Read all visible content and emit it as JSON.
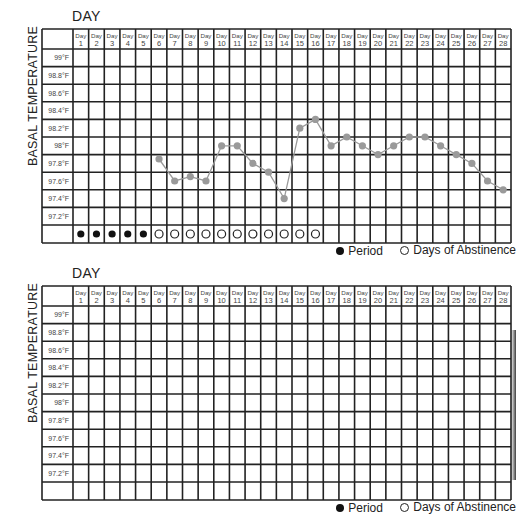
{
  "charts": [
    {
      "x_title": "DAY",
      "y_title": "BASAL TEMPERATURE",
      "legend": {
        "period_label": "Period",
        "abstinence_label": "Days of Abstinence"
      }
    },
    {
      "x_title": "DAY",
      "y_title": "BASAL TEMPERATURE",
      "legend": {
        "period_label": "Period",
        "abstinence_label": "Days of Abstinence"
      }
    }
  ],
  "colors": {
    "grid": "#222222",
    "series": "#9a9a9a",
    "period": "#111111"
  },
  "chart_data": [
    {
      "type": "line",
      "title": "",
      "xlabel": "DAY",
      "ylabel": "BASAL TEMPERATURE",
      "day_label_prefix": "Day",
      "x": [
        1,
        2,
        3,
        4,
        5,
        6,
        7,
        8,
        9,
        10,
        11,
        12,
        13,
        14,
        15,
        16,
        17,
        18,
        19,
        20,
        21,
        22,
        23,
        24,
        25,
        26,
        27,
        28
      ],
      "y_tick_labels": [
        "99°F",
        "98.8°F",
        "98.6°F",
        "98.4°F",
        "98.2°F",
        "98°F",
        "97.8°F",
        "97.6°F",
        "97.4°F",
        "97.2°F"
      ],
      "y_ticks": [
        99.0,
        98.8,
        98.6,
        98.4,
        98.2,
        98.0,
        97.8,
        97.6,
        97.4,
        97.2
      ],
      "ylim": [
        97.1,
        99.1
      ],
      "grid": true,
      "series": [
        {
          "name": "Basal temperature",
          "points": [
            {
              "day": 6,
              "temp": 97.85
            },
            {
              "day": 7,
              "temp": 97.6
            },
            {
              "day": 8,
              "temp": 97.65
            },
            {
              "day": 9,
              "temp": 97.6
            },
            {
              "day": 10,
              "temp": 98.0
            },
            {
              "day": 11,
              "temp": 98.0
            },
            {
              "day": 12,
              "temp": 97.8
            },
            {
              "day": 13,
              "temp": 97.7
            },
            {
              "day": 14,
              "temp": 97.4
            },
            {
              "day": 15,
              "temp": 98.2
            },
            {
              "day": 16,
              "temp": 98.3
            },
            {
              "day": 17,
              "temp": 98.0
            },
            {
              "day": 18,
              "temp": 98.1
            },
            {
              "day": 19,
              "temp": 98.0
            },
            {
              "day": 20,
              "temp": 97.9
            },
            {
              "day": 21,
              "temp": 98.0
            },
            {
              "day": 22,
              "temp": 98.1
            },
            {
              "day": 23,
              "temp": 98.1
            },
            {
              "day": 24,
              "temp": 98.0
            },
            {
              "day": 25,
              "temp": 97.9
            },
            {
              "day": 26,
              "temp": 97.8
            },
            {
              "day": 27,
              "temp": 97.6
            },
            {
              "day": 28,
              "temp": 97.5
            }
          ]
        }
      ],
      "markers": {
        "period_days": [
          1,
          2,
          3,
          4,
          5
        ],
        "abstinence_days": [
          6,
          7,
          8,
          9,
          10,
          11,
          12,
          13,
          14,
          15,
          16
        ]
      },
      "legend": [
        "Period",
        "Days of Abstinence"
      ],
      "legend_position": "bottom-right"
    },
    {
      "type": "line",
      "title": "",
      "xlabel": "DAY",
      "ylabel": "BASAL TEMPERATURE",
      "day_label_prefix": "Day",
      "x": [
        1,
        2,
        3,
        4,
        5,
        6,
        7,
        8,
        9,
        10,
        11,
        12,
        13,
        14,
        15,
        16,
        17,
        18,
        19,
        20,
        21,
        22,
        23,
        24,
        25,
        26,
        27,
        28
      ],
      "y_tick_labels": [
        "99°F",
        "98.8°F",
        "98.6°F",
        "98.4°F",
        "98.2°F",
        "98°F",
        "97.8°F",
        "97.6°F",
        "97.4°F",
        "97.2°F"
      ],
      "y_ticks": [
        99.0,
        98.8,
        98.6,
        98.4,
        98.2,
        98.0,
        97.8,
        97.6,
        97.4,
        97.2
      ],
      "ylim": [
        97.1,
        99.1
      ],
      "grid": true,
      "series": [],
      "markers": {
        "period_days": [],
        "abstinence_days": []
      },
      "legend": [
        "Period",
        "Days of Abstinence"
      ],
      "legend_position": "bottom-right"
    }
  ]
}
